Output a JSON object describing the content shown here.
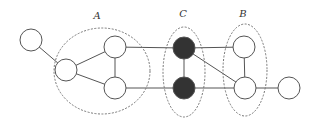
{
  "diagram": {
    "colors": {
      "background": "#ffffff",
      "stroke": "#555555",
      "node_fill": "#ffffff",
      "highlight_fill": "#333333",
      "group_stroke": "#777777"
    },
    "groups": [
      {
        "id": "A",
        "label": "A",
        "cx": 102,
        "cy": 71,
        "rx": 48,
        "ry": 43,
        "label_x": 97,
        "label_y": 19
      },
      {
        "id": "C",
        "label": "C",
        "cx": 184,
        "cy": 72,
        "rx": 21,
        "ry": 45,
        "label_x": 183,
        "label_y": 17
      },
      {
        "id": "B",
        "label": "B",
        "cx": 245,
        "cy": 70,
        "rx": 22,
        "ry": 46,
        "label_x": 243,
        "label_y": 17
      }
    ],
    "nodes": [
      {
        "id": "n1",
        "x": 31,
        "y": 40,
        "r": 11,
        "filled": false,
        "group": null
      },
      {
        "id": "n2",
        "x": 66,
        "y": 70,
        "r": 11,
        "filled": false,
        "group": "A"
      },
      {
        "id": "n3",
        "x": 115,
        "y": 47,
        "r": 11,
        "filled": false,
        "group": "A"
      },
      {
        "id": "n4",
        "x": 115,
        "y": 88,
        "r": 11,
        "filled": false,
        "group": "A"
      },
      {
        "id": "n5",
        "x": 184,
        "y": 48,
        "r": 11,
        "filled": true,
        "group": "C"
      },
      {
        "id": "n6",
        "x": 184,
        "y": 88,
        "r": 11,
        "filled": true,
        "group": "C"
      },
      {
        "id": "n7",
        "x": 244,
        "y": 47,
        "r": 11,
        "filled": false,
        "group": "B"
      },
      {
        "id": "n8",
        "x": 245,
        "y": 88,
        "r": 11,
        "filled": false,
        "group": "B"
      },
      {
        "id": "n9",
        "x": 289,
        "y": 88,
        "r": 11,
        "filled": false,
        "group": null
      }
    ],
    "edges": [
      [
        "n1",
        "n2"
      ],
      [
        "n2",
        "n3"
      ],
      [
        "n2",
        "n4"
      ],
      [
        "n3",
        "n4"
      ],
      [
        "n3",
        "n5"
      ],
      [
        "n4",
        "n6"
      ],
      [
        "n5",
        "n6"
      ],
      [
        "n5",
        "n7"
      ],
      [
        "n5",
        "n8"
      ],
      [
        "n6",
        "n8"
      ],
      [
        "n7",
        "n8"
      ],
      [
        "n8",
        "n9"
      ]
    ]
  }
}
